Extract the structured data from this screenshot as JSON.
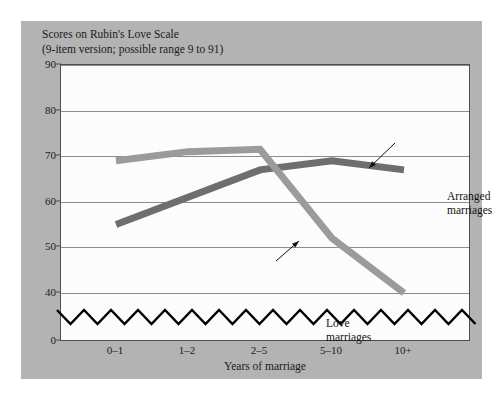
{
  "figure": {
    "title_line1": "Scores on Rubin's Love Scale",
    "title_line2": "(9-item version; possible range 9 to 91)",
    "panel_color": "#b3b3b3",
    "plot_background": "#fcfcfc"
  },
  "chart_data": {
    "type": "line",
    "title": "Scores on Rubin's Love Scale (9-item version; possible range 9 to 91)",
    "xlabel": "Years of marriage",
    "ylabel": "",
    "categories": [
      "0–1",
      "1–2",
      "2–5",
      "5–10",
      "10+"
    ],
    "yticks": [
      0,
      40,
      50,
      60,
      70,
      80,
      90
    ],
    "ylim": [
      0,
      90
    ],
    "axis_break": true,
    "axis_break_between": [
      0,
      40
    ],
    "grid": true,
    "legend": "annotations",
    "series": [
      {
        "name": "Arranged marriages",
        "values": [
          55,
          61,
          67,
          69,
          67
        ],
        "color": "#6e6e6e"
      },
      {
        "name": "Love marriages",
        "values": [
          69,
          71,
          71.5,
          52,
          40
        ],
        "color": "#9b9b9b"
      }
    ],
    "annotations": [
      {
        "label_line1": "Arranged",
        "label_line2": "marriages"
      },
      {
        "label_line1": "Love",
        "label_line2": "marriages"
      }
    ]
  }
}
